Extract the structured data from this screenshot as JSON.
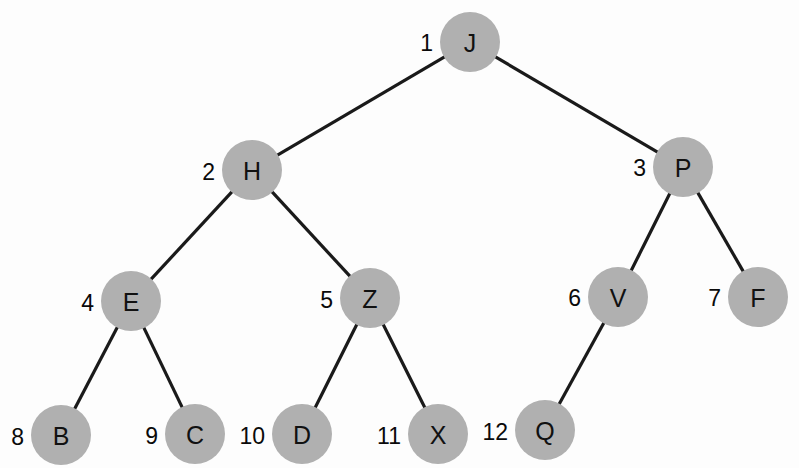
{
  "diagram": {
    "type": "binary-tree",
    "background_color": "#fdfdfd",
    "node_fill_color": "#b0b0b0",
    "edge_color": "#1a1a1a",
    "label_color": "#111111",
    "node_radius": 30,
    "canvas": {
      "width": 799,
      "height": 468
    }
  },
  "nodes": [
    {
      "id": "n1",
      "index": "1",
      "label": "J",
      "cx": 470,
      "cy": 42,
      "index_x": 433,
      "index_y": 43,
      "depth": 0
    },
    {
      "id": "n2",
      "index": "2",
      "label": "H",
      "cx": 252,
      "cy": 170,
      "index_x": 215,
      "index_y": 172,
      "depth": 1
    },
    {
      "id": "n3",
      "index": "3",
      "label": "P",
      "cx": 683,
      "cy": 167,
      "index_x": 646,
      "index_y": 168,
      "depth": 1
    },
    {
      "id": "n4",
      "index": "4",
      "label": "E",
      "cx": 131,
      "cy": 301,
      "index_x": 94,
      "index_y": 303,
      "depth": 2
    },
    {
      "id": "n5",
      "index": "5",
      "label": "Z",
      "cx": 370,
      "cy": 298,
      "index_x": 333,
      "index_y": 300,
      "depth": 2
    },
    {
      "id": "n6",
      "index": "6",
      "label": "V",
      "cx": 618,
      "cy": 297,
      "index_x": 581,
      "index_y": 298,
      "depth": 2
    },
    {
      "id": "n7",
      "index": "7",
      "label": "F",
      "cx": 758,
      "cy": 297,
      "index_x": 721,
      "index_y": 298,
      "depth": 2
    },
    {
      "id": "n8",
      "index": "8",
      "label": "B",
      "cx": 61,
      "cy": 435,
      "index_x": 24,
      "index_y": 437,
      "depth": 3
    },
    {
      "id": "n9",
      "index": "9",
      "label": "C",
      "cx": 195,
      "cy": 434,
      "index_x": 158,
      "index_y": 436,
      "depth": 3
    },
    {
      "id": "n10",
      "index": "10",
      "label": "D",
      "cx": 302,
      "cy": 434,
      "index_x": 265,
      "index_y": 436,
      "depth": 3
    },
    {
      "id": "n11",
      "index": "11",
      "label": "X",
      "cx": 438,
      "cy": 434,
      "index_x": 401,
      "index_y": 436,
      "depth": 3
    },
    {
      "id": "n12",
      "index": "12",
      "label": "Q",
      "cx": 545,
      "cy": 430,
      "index_x": 508,
      "index_y": 432,
      "depth": 3
    }
  ],
  "edges": [
    {
      "id": "e1",
      "from": "n1",
      "to": "n2",
      "from_label": "J",
      "to_label": "H"
    },
    {
      "id": "e2",
      "from": "n1",
      "to": "n3",
      "from_label": "J",
      "to_label": "P"
    },
    {
      "id": "e3",
      "from": "n2",
      "to": "n4",
      "from_label": "H",
      "to_label": "E"
    },
    {
      "id": "e4",
      "from": "n2",
      "to": "n5",
      "from_label": "H",
      "to_label": "Z"
    },
    {
      "id": "e5",
      "from": "n3",
      "to": "n6",
      "from_label": "P",
      "to_label": "V"
    },
    {
      "id": "e6",
      "from": "n3",
      "to": "n7",
      "from_label": "P",
      "to_label": "F"
    },
    {
      "id": "e7",
      "from": "n4",
      "to": "n8",
      "from_label": "E",
      "to_label": "B"
    },
    {
      "id": "e8",
      "from": "n4",
      "to": "n9",
      "from_label": "E",
      "to_label": "C"
    },
    {
      "id": "e9",
      "from": "n5",
      "to": "n10",
      "from_label": "Z",
      "to_label": "D"
    },
    {
      "id": "e10",
      "from": "n5",
      "to": "n11",
      "from_label": "Z",
      "to_label": "X"
    },
    {
      "id": "e11",
      "from": "n6",
      "to": "n12",
      "from_label": "V",
      "to_label": "Q"
    }
  ]
}
